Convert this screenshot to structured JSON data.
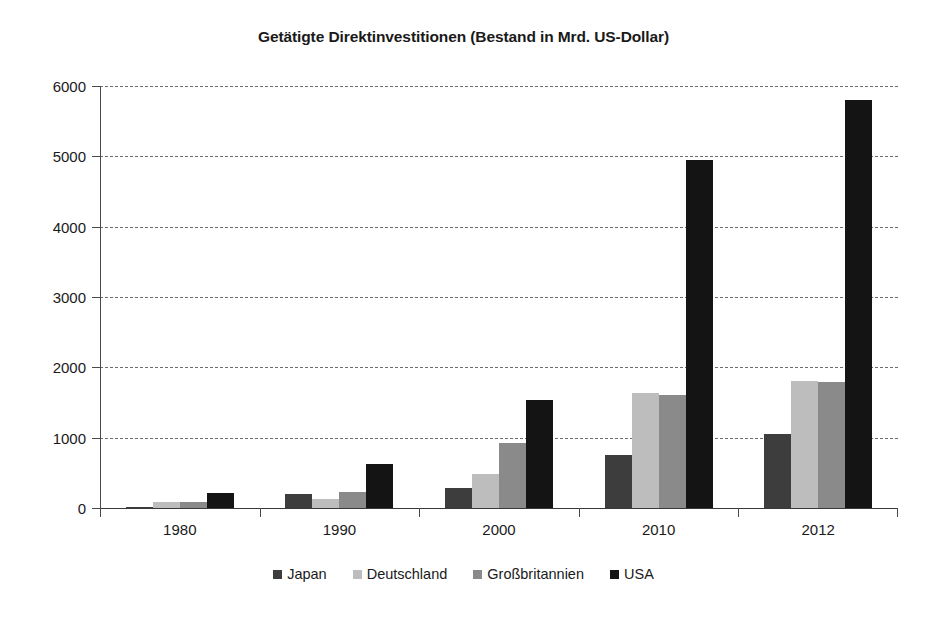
{
  "chart_data": {
    "type": "bar",
    "title": "Getätigte Direktinvestitionen (Bestand in Mrd. US-Dollar)",
    "xlabel": "",
    "ylabel": "",
    "categories": [
      "1980",
      "1990",
      "2000",
      "2010",
      "2012"
    ],
    "series": [
      {
        "name": "Japan",
        "color": "#3d3d3d",
        "values": [
          20,
          200,
          280,
          760,
          1050
        ]
      },
      {
        "name": "Deutschland",
        "color": "#bdbdbd",
        "values": [
          85,
          130,
          490,
          1630,
          1810
        ]
      },
      {
        "name": "Großbritannien",
        "color": "#8a8a8a",
        "values": [
          80,
          230,
          930,
          1610,
          1790
        ]
      },
      {
        "name": "USA",
        "color": "#141414",
        "values": [
          220,
          620,
          1540,
          4950,
          5800
        ]
      }
    ],
    "ylim": [
      0,
      6000
    ],
    "yticks": [
      0,
      1000,
      2000,
      3000,
      4000,
      5000,
      6000
    ],
    "ytick_labels": [
      "0",
      "1000",
      "2000",
      "3000",
      "4000",
      "5000",
      "6000"
    ],
    "grid": true,
    "grid_style": "dashed-horizontal",
    "legend_position": "bottom",
    "legend_entries": [
      "Japan",
      "Deutschland",
      "Großbritannien",
      "USA"
    ]
  }
}
